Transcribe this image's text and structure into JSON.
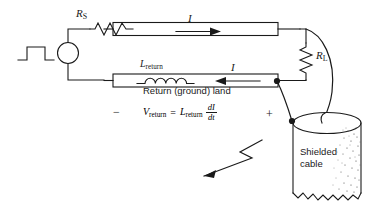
{
  "figure": {
    "type": "circuit-schematic",
    "background_color": "#ffffff",
    "line_color": "#1a1a1a",
    "labels": {
      "source_resistor": "R",
      "source_resistor_sub": "S",
      "load_resistor": "R",
      "load_resistor_sub": "L",
      "current_top": "I",
      "current_bottom": "I",
      "return_inductor": "L",
      "return_inductor_sub": "return",
      "ground_land": "Return (ground) land",
      "polarity_minus": "−",
      "polarity_plus": "+",
      "cable_line1": "Shielded",
      "cable_line2": "cable"
    },
    "equation": {
      "lhs": "V",
      "lhs_sub": "return",
      "equals": "=",
      "rhs": "L",
      "rhs_sub": "return",
      "derivative_numerator": "dI",
      "derivative_denominator": "dt"
    },
    "components": [
      {
        "name": "pulse-source-waveform",
        "kind": "waveform",
        "shape": "square-pulse"
      },
      {
        "name": "voltage-source",
        "kind": "source",
        "shape": "circle",
        "plus": "+",
        "minus": "−"
      },
      {
        "name": "series-resistor",
        "kind": "resistor",
        "orientation": "horizontal"
      },
      {
        "name": "signal-land",
        "kind": "trace",
        "orientation": "horizontal"
      },
      {
        "name": "load-resistor",
        "kind": "resistor",
        "orientation": "vertical"
      },
      {
        "name": "return-land",
        "kind": "trace",
        "orientation": "horizontal"
      },
      {
        "name": "return-inductor",
        "kind": "inductor",
        "orientation": "horizontal"
      },
      {
        "name": "shielded-cable",
        "kind": "cylinder",
        "fill": "stippled",
        "bottom_edge": "torn"
      },
      {
        "name": "radiation-arrow",
        "kind": "zigzag-arrow",
        "direction": "left"
      }
    ]
  }
}
